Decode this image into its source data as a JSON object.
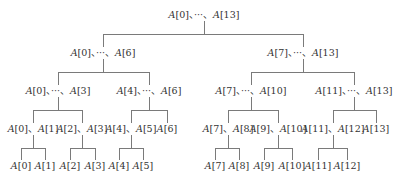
{
  "diagram": {
    "type": "binary-partition-tree",
    "line_color": "#7a7a7a",
    "text_color": "#333333",
    "separator": "、",
    "nodes": [
      {
        "id": "root",
        "label": "A[0]、···、A[13]",
        "x": 204,
        "y": 15
      },
      {
        "id": "l1a",
        "label": "A[0]、···、A[6]",
        "x": 103,
        "y": 53
      },
      {
        "id": "l1b",
        "label": "A[7]、···、A[13]",
        "x": 303,
        "y": 53
      },
      {
        "id": "l2a",
        "label": "A[0]、···、A[3]",
        "x": 58,
        "y": 91
      },
      {
        "id": "l2b",
        "label": "A[4]、···、A[6]",
        "x": 149,
        "y": 91
      },
      {
        "id": "l2c",
        "label": "A[7]、···、A[10]",
        "x": 251,
        "y": 91
      },
      {
        "id": "l2d",
        "label": "A[11]、···、A[13]",
        "x": 354,
        "y": 91
      },
      {
        "id": "l3a",
        "label": "A[0]、A[1]",
        "x": 33,
        "y": 129
      },
      {
        "id": "l3b",
        "label": "A[2]、A[3]",
        "x": 82,
        "y": 129
      },
      {
        "id": "l3c",
        "label": "A[4]、A[5]",
        "x": 131,
        "y": 129
      },
      {
        "id": "l3d",
        "label": "A[6]",
        "x": 167,
        "y": 129
      },
      {
        "id": "l3e",
        "label": "A[7]、A[8]",
        "x": 228,
        "y": 129
      },
      {
        "id": "l3f",
        "label": "A[9]、A[10]",
        "x": 278,
        "y": 129
      },
      {
        "id": "l3g",
        "label": "A[11]、A[12]",
        "x": 333,
        "y": 129
      },
      {
        "id": "l3h",
        "label": "A[13]",
        "x": 376,
        "y": 129
      },
      {
        "id": "leaf0",
        "label": "A[0]",
        "x": 21,
        "y": 166
      },
      {
        "id": "leaf1",
        "label": "A[1]",
        "x": 45,
        "y": 166
      },
      {
        "id": "leaf2",
        "label": "A[2]",
        "x": 70,
        "y": 166
      },
      {
        "id": "leaf3",
        "label": "A[3]",
        "x": 95,
        "y": 166
      },
      {
        "id": "leaf4",
        "label": "A[4]",
        "x": 119,
        "y": 166
      },
      {
        "id": "leaf5",
        "label": "A[5]",
        "x": 143,
        "y": 166
      },
      {
        "id": "leaf7",
        "label": "A[7]",
        "x": 215,
        "y": 166
      },
      {
        "id": "leaf8",
        "label": "A[8]",
        "x": 239,
        "y": 166
      },
      {
        "id": "leaf9",
        "label": "A[9]",
        "x": 264,
        "y": 166
      },
      {
        "id": "leaf10",
        "label": "A[10]",
        "x": 292,
        "y": 166
      },
      {
        "id": "leaf11",
        "label": "A[11]",
        "x": 318,
        "y": 166
      },
      {
        "id": "leaf12",
        "label": "A[12]",
        "x": 347,
        "y": 166
      }
    ],
    "edges": [
      {
        "parent": "root",
        "children": [
          "l1a",
          "l1b"
        ]
      },
      {
        "parent": "l1a",
        "children": [
          "l2a",
          "l2b"
        ]
      },
      {
        "parent": "l1b",
        "children": [
          "l2c",
          "l2d"
        ]
      },
      {
        "parent": "l2a",
        "children": [
          "l3a",
          "l3b"
        ]
      },
      {
        "parent": "l2b",
        "children": [
          "l3c",
          "l3d"
        ]
      },
      {
        "parent": "l2c",
        "children": [
          "l3e",
          "l3f"
        ]
      },
      {
        "parent": "l2d",
        "children": [
          "l3g",
          "l3h"
        ]
      },
      {
        "parent": "l3a",
        "children": [
          "leaf0",
          "leaf1"
        ]
      },
      {
        "parent": "l3b",
        "children": [
          "leaf2",
          "leaf3"
        ]
      },
      {
        "parent": "l3c",
        "children": [
          "leaf4",
          "leaf5"
        ]
      },
      {
        "parent": "l3e",
        "children": [
          "leaf7",
          "leaf8"
        ]
      },
      {
        "parent": "l3f",
        "children": [
          "leaf9",
          "leaf10"
        ]
      },
      {
        "parent": "l3g",
        "children": [
          "leaf11",
          "leaf12"
        ]
      }
    ]
  }
}
